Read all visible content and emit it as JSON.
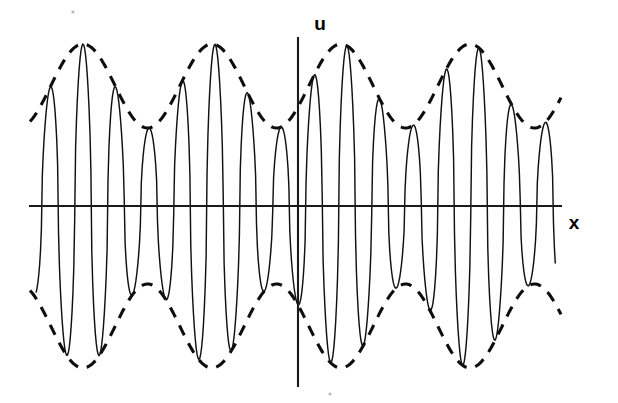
{
  "figure": {
    "background_color": "#ffffff",
    "stroke_color": "#111111",
    "width": 618,
    "height": 403
  },
  "axes": {
    "vertical": {
      "label": "u",
      "label_x": 320,
      "label_y": 30,
      "x": 298,
      "y_top": 38,
      "y_bottom": 386
    },
    "horizontal": {
      "label": "x",
      "label_x": 574,
      "label_y": 229,
      "y": 206,
      "x_left": 30,
      "x_right": 561
    }
  },
  "chart_data": {
    "type": "line",
    "xlabel": "x",
    "ylabel": "u",
    "grid": false,
    "legend": null,
    "axis_origin_px": {
      "x": 298,
      "y": 206
    },
    "xlim_px": [
      30,
      561
    ],
    "ylim_px": [
      38,
      386
    ],
    "series": [
      {
        "name": "carrier",
        "style": "solid",
        "description": "High-frequency carrier oscillation u = A(x)*cos(k*x)",
        "carrier_period_px": 33.0,
        "carrier_half_period_px": 16.5,
        "phase_px": 0.0,
        "zero_crossing_y_px": 206,
        "x_start_px": 36,
        "x_end_px": 556
      },
      {
        "name": "upper-envelope",
        "style": "dashed",
        "description": "Upper modulation envelope +A(x)",
        "peaks_x_px": [
          83,
          213,
          341,
          470
        ],
        "minima_x_px": [
          148,
          277,
          406,
          535
        ],
        "peak_y_px": 44,
        "min_y_px": 128
      },
      {
        "name": "lower-envelope",
        "style": "dashed",
        "description": "Lower modulation envelope -A(x)",
        "troughs_x_px": [
          83,
          213,
          341,
          470
        ],
        "maxima_x_px": [
          148,
          277,
          406,
          535
        ],
        "trough_y_px": 370,
        "max_y_px": 286
      }
    ],
    "envelope": {
      "period_px": 129.0,
      "amplitude_max_px": 162,
      "amplitude_min_px": 78,
      "amplitude_mean_px": 120,
      "amplitude_swing_px": 42,
      "modulation_depth": 0.35,
      "beat_count_visible": 4
    }
  }
}
